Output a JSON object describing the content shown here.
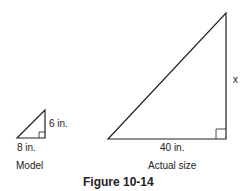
{
  "figure": {
    "caption": "Figure 10-14",
    "model": {
      "title": "Model",
      "base_label": "8 in.",
      "height_label": "6 in."
    },
    "actual": {
      "title": "Actual size",
      "base_label": "40 in.",
      "height_label": "x"
    }
  }
}
